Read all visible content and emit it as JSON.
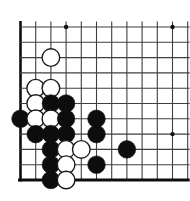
{
  "board": {
    "kind": "go-diagram",
    "background": "#ffffff",
    "line_color": "#3f3f3f",
    "edge_color": "#0d0d0d",
    "star_color": "#111111",
    "white_stone_fill": "#ffffff",
    "white_stone_stroke": "#1a1a1a",
    "black_stone_fill": "#0d0d0d",
    "cols": 12,
    "rows": 11,
    "origin_x": 20.5,
    "origin_y": 27,
    "cell_w": 15.2,
    "cell_h": 15.3,
    "top_overhang": 5.5,
    "right_overrun": 2.0,
    "left_edge_width": 2.6,
    "bottom_edge_width": 3,
    "thin_line_width": 1.1,
    "stone_radius": 8.8,
    "star_radius": 2.2,
    "star_points": [
      {
        "col": 3,
        "row": 0
      },
      {
        "col": 10,
        "row": 0
      },
      {
        "col": 10,
        "row": 7
      }
    ],
    "stones": [
      {
        "color": "white",
        "col": 2,
        "row": 2
      },
      {
        "color": "white",
        "col": 1,
        "row": 4
      },
      {
        "color": "white",
        "col": 2,
        "row": 4
      },
      {
        "color": "white",
        "col": 1,
        "row": 5
      },
      {
        "color": "black",
        "col": 2,
        "row": 5
      },
      {
        "color": "black",
        "col": 3,
        "row": 5
      },
      {
        "color": "black",
        "col": 0,
        "row": 6
      },
      {
        "color": "white",
        "col": 1,
        "row": 6
      },
      {
        "color": "white",
        "col": 2,
        "row": 6
      },
      {
        "color": "black",
        "col": 3,
        "row": 6
      },
      {
        "color": "black",
        "col": 5,
        "row": 6
      },
      {
        "color": "black",
        "col": 1,
        "row": 7
      },
      {
        "color": "black",
        "col": 2,
        "row": 7
      },
      {
        "color": "black",
        "col": 3,
        "row": 7
      },
      {
        "color": "black",
        "col": 5,
        "row": 7
      },
      {
        "color": "black",
        "col": 2,
        "row": 8
      },
      {
        "color": "white",
        "col": 3,
        "row": 8
      },
      {
        "color": "white",
        "col": 4,
        "row": 8
      },
      {
        "color": "black",
        "col": 7,
        "row": 8
      },
      {
        "color": "black",
        "col": 2,
        "row": 9
      },
      {
        "color": "white",
        "col": 3,
        "row": 9
      },
      {
        "color": "black",
        "col": 5,
        "row": 9
      },
      {
        "color": "black",
        "col": 2,
        "row": 10
      },
      {
        "color": "white",
        "col": 3,
        "row": 10
      }
    ]
  }
}
